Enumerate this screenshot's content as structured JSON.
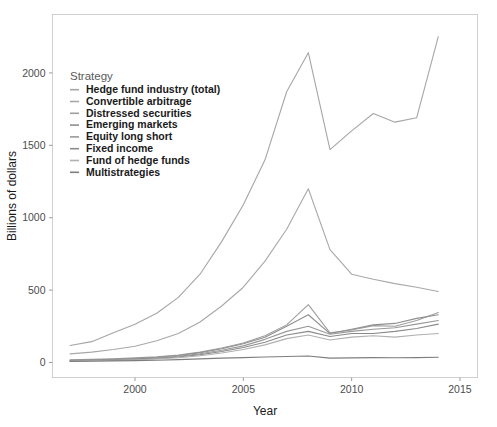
{
  "chart_data": {
    "type": "line",
    "title": "",
    "xlabel": "Year",
    "ylabel": "Billions of dollars",
    "xlim": [
      1997,
      2015
    ],
    "ylim": [
      0,
      2300
    ],
    "xticks": [
      2000,
      2005,
      2010,
      2015
    ],
    "xtick_labels": [
      "2000",
      "2005",
      "2010",
      "2015"
    ],
    "yticks": [
      0,
      500,
      1000,
      1500,
      2000
    ],
    "ytick_labels": [
      "0",
      "500",
      "1000",
      "1500",
      "2000"
    ],
    "grid": false,
    "legend_position": "inside-top-left",
    "legend_title": "Strategy",
    "x": [
      1997,
      1998,
      1999,
      2000,
      2001,
      2002,
      2003,
      2004,
      2005,
      2006,
      2007,
      2008,
      2009,
      2010,
      2011,
      2012,
      2013,
      2014
    ],
    "series": [
      {
        "name": "Hedge fund industry (total)",
        "color": "#a6a6a6",
        "values": [
          118,
          144,
          205,
          265,
          340,
          450,
          610,
          835,
          1090,
          1400,
          1870,
          2140,
          1470,
          1600,
          1720,
          1660,
          1690,
          2250
        ]
      },
      {
        "name": "Convertible arbitrage",
        "color": "#a8a8a8",
        "values": [
          60,
          72,
          90,
          112,
          150,
          200,
          280,
          390,
          520,
          700,
          920,
          1200,
          780,
          610,
          575,
          545,
          520,
          490
        ]
      },
      {
        "name": "Distressed securities",
        "color": "#9e9e9e",
        "values": [
          18,
          22,
          26,
          32,
          40,
          52,
          72,
          100,
          135,
          185,
          260,
          400,
          205,
          225,
          255,
          250,
          290,
          345
        ]
      },
      {
        "name": "Emerging markets",
        "color": "#8f8f8f",
        "values": [
          16,
          19,
          23,
          28,
          36,
          48,
          68,
          95,
          130,
          175,
          250,
          330,
          200,
          230,
          260,
          270,
          305,
          330
        ]
      },
      {
        "name": "Equity long short",
        "color": "#999999",
        "values": [
          14,
          17,
          21,
          25,
          32,
          43,
          60,
          85,
          115,
          160,
          215,
          250,
          195,
          215,
          230,
          240,
          265,
          290
        ]
      },
      {
        "name": "Fixed income",
        "color": "#8a8a8a",
        "values": [
          12,
          14,
          18,
          22,
          28,
          38,
          54,
          76,
          104,
          140,
          190,
          215,
          180,
          200,
          200,
          215,
          235,
          265
        ]
      },
      {
        "name": "Fund of hedge funds",
        "color": "#b0b0b0",
        "values": [
          10,
          12,
          15,
          19,
          24,
          33,
          47,
          66,
          90,
          122,
          165,
          190,
          155,
          175,
          185,
          175,
          190,
          200
        ]
      },
      {
        "name": "Multistrategies",
        "color": "#7e7e7e",
        "values": [
          8,
          9,
          11,
          13,
          16,
          20,
          25,
          30,
          34,
          38,
          42,
          45,
          30,
          32,
          34,
          33,
          34,
          36
        ]
      }
    ]
  },
  "legend": {
    "title": "Strategy",
    "entries": [
      {
        "label": "Hedge fund industry (total)"
      },
      {
        "label": "Convertible arbitrage"
      },
      {
        "label": "Distressed securities"
      },
      {
        "label": "Emerging markets"
      },
      {
        "label": "Equity long short"
      },
      {
        "label": "Fixed income"
      },
      {
        "label": "Fund of hedge funds"
      },
      {
        "label": "Multistrategies"
      }
    ]
  },
  "axes": {
    "x_title": "Year",
    "y_title": "Billions of dollars",
    "x_tick_labels": [
      "2000",
      "2005",
      "2010",
      "2015"
    ],
    "y_tick_labels": [
      "0",
      "500",
      "1000",
      "1500",
      "2000"
    ]
  },
  "colors": {
    "panel_border": "#d0d0d0",
    "tick": "#9a9a9a",
    "text": "#1a1a1a",
    "tick_text": "#4d4d4d",
    "background": "#ffffff"
  }
}
